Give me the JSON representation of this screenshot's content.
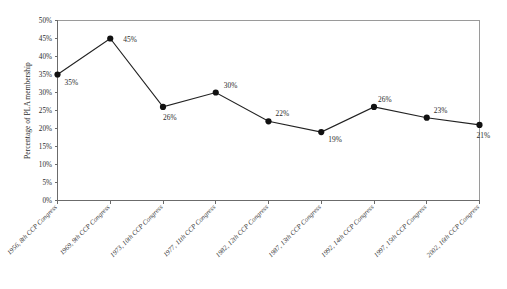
{
  "chart_data": {
    "type": "line",
    "title": "",
    "xlabel": "",
    "ylabel": "Percentage of PLA membership",
    "ylim": [
      0,
      50
    ],
    "ytick_labels": [
      "50%",
      "45%",
      "40%",
      "35%",
      "30%",
      "25%",
      "20%",
      "15%",
      "10%",
      "5%",
      "0%"
    ],
    "ytick_values": [
      50,
      45,
      40,
      35,
      30,
      25,
      20,
      15,
      10,
      5,
      0
    ],
    "grid": false,
    "legend": "none",
    "marker": "filled-circle",
    "categories": [
      "1956, 8th CCP Congress",
      "1969, 9th CCP Congress",
      "1973, 10th CCP Congress",
      "1977, 11th CCP Congress",
      "1982, 12th CCP Congress",
      "1987, 13th CCP Congress",
      "1992, 14th CCP Congress",
      "1997, 15th CCP Congress",
      "2002, 16th CCP Congress"
    ],
    "values": [
      35,
      45,
      26,
      30,
      22,
      19,
      26,
      23,
      21
    ],
    "data_labels": [
      "35%",
      "45%",
      "26%",
      "30%",
      "22%",
      "19%",
      "26%",
      "23%",
      "21%"
    ],
    "series": [
      {
        "name": "Percentage of PLA membership",
        "values": [
          35,
          45,
          26,
          30,
          22,
          19,
          26,
          23,
          21
        ]
      }
    ]
  },
  "colors": {
    "line": "#222222",
    "marker": "#111111",
    "axis": "#6b6b6b",
    "frame": "#9a9a9a",
    "text": "#2b2b2b",
    "background": "#ffffff"
  }
}
